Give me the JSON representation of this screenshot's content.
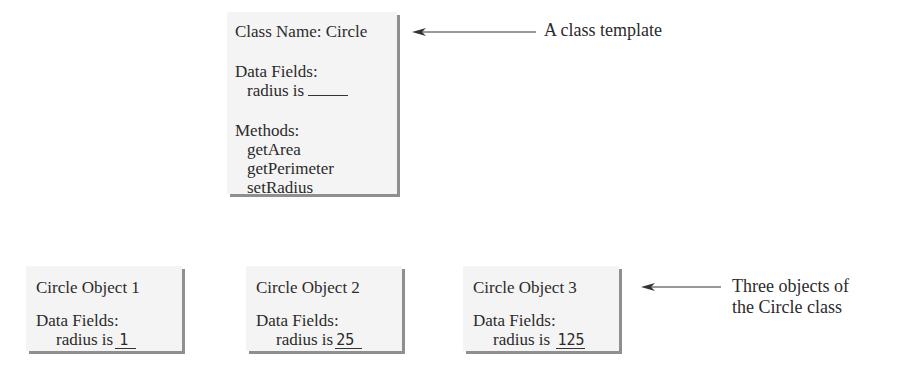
{
  "class_template": {
    "title": "Class Name: Circle",
    "data_fields_label": "Data Fields:",
    "field": "radius is",
    "methods_label": "Methods:",
    "methods": [
      "getArea",
      "getPerimeter",
      "setRadius"
    ]
  },
  "objects": [
    {
      "title": "Circle Object 1",
      "data_fields_label": "Data Fields:",
      "field": "radius is",
      "value": "1"
    },
    {
      "title": "Circle Object 2",
      "data_fields_label": "Data Fields:",
      "field": "radius is",
      "value": "25"
    },
    {
      "title": "Circle Object 3",
      "data_fields_label": "Data Fields:",
      "field": "radius is",
      "value": "125"
    }
  ],
  "annotations": {
    "class_note": "A class template",
    "objects_note_line1": "Three objects of",
    "objects_note_line2": "the Circle class"
  },
  "colors": {
    "box_fill": "#f4f4f4",
    "box_shadow": "#8f8f8f",
    "text": "#2b2b2b"
  }
}
